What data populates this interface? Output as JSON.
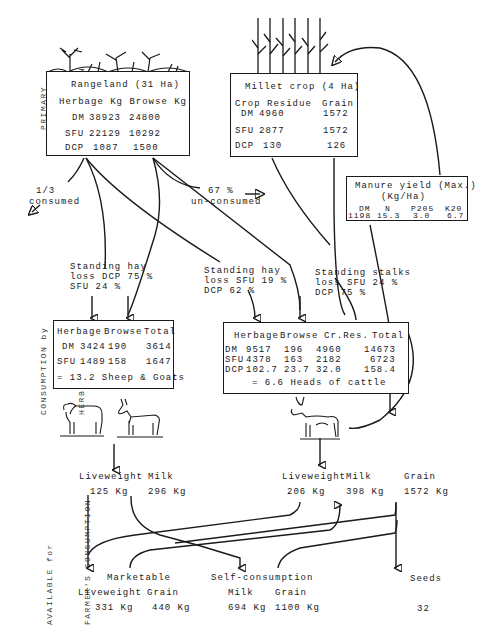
{
  "side_labels": {
    "primary": [
      "PRIMARY",
      "PRODUCTION"
    ],
    "consumption": [
      "CONSUMPTION by",
      "HERBIVORES"
    ],
    "available": [
      "AVAILABLE for",
      "FARMER'S CONSUMPTION"
    ]
  },
  "rangeland": {
    "title": "Rangeland (31 Ha)",
    "header": "Herbage Kg Browse Kg",
    "rows": [
      {
        "label": "DM",
        "herbage": "38923",
        "browse": "24800"
      },
      {
        "label": "SFU",
        "herbage": "22129",
        "browse": "10292"
      },
      {
        "label": "DCP",
        "herbage": "1087",
        "browse": "1500"
      }
    ]
  },
  "millet": {
    "title": "Millet crop (4 Ha)",
    "header_residue": "Crop Residue",
    "header_grain": "Grain",
    "rows": [
      {
        "label": "DM",
        "residue": "4960",
        "grain": "1572"
      },
      {
        "label": "SFU",
        "residue": "2877",
        "grain": "1572"
      },
      {
        "label": "DCP",
        "residue": "130",
        "grain": "126"
      }
    ]
  },
  "manure": {
    "title": "Manure yield (Max.)",
    "unit": "(Kg/Ha)",
    "cols": [
      "DM",
      "N",
      "P205",
      "K20"
    ],
    "values": [
      "1198",
      "15.3",
      "3.0",
      "6.7"
    ]
  },
  "annotations": {
    "consumed": [
      "1/3",
      "consumed"
    ],
    "unconsumed": [
      "67 %",
      "un-consumed"
    ],
    "hay1": [
      "Standing hay",
      "loss DCP 75 %",
      "SFU 24 %"
    ],
    "hay2": [
      "Standing hay",
      "loss SFU 19 %",
      "DCP 62 %"
    ],
    "stalks": [
      "Standing stalks",
      "loss SFU 24 %",
      "DCP 75 %"
    ]
  },
  "small_stock": {
    "header": [
      "Herbage",
      "Browse",
      "Total"
    ],
    "rows": [
      {
        "label": "DM",
        "herbage": "3424",
        "browse": "190",
        "total": "3614"
      },
      {
        "label": "SFU",
        "herbage": "1489",
        "browse": "158",
        "total": "1647"
      }
    ],
    "equivalent": "= 13.2 Sheep & Goats"
  },
  "cattle": {
    "header": [
      "Herbage",
      "Browse",
      "Cr.Res.",
      "Total"
    ],
    "rows": [
      {
        "label": "DM",
        "herbage": "9517",
        "browse": "196",
        "crres": "4960",
        "total": "14673"
      },
      {
        "label": "SFU",
        "herbage": "4378",
        "browse": "163",
        "crres": "2182",
        "total": "6723"
      },
      {
        "label": "DCP",
        "herbage": "102.7",
        "browse": "23.7",
        "crres": "32.0",
        "total": "158.4"
      }
    ],
    "equivalent": "= 6.6 Heads of cattle"
  },
  "outputs": {
    "small_stock": {
      "lw_label": "Liveweight",
      "milk_label": "Milk",
      "lw": "125 Kg",
      "milk": "296 Kg"
    },
    "cattle": {
      "lw_label": "Liveweight",
      "milk_label": "Milk",
      "lw": "206 Kg",
      "milk": "398 Kg"
    },
    "grain": {
      "label": "Grain",
      "value": "1572 Kg"
    }
  },
  "final": {
    "marketable": {
      "title": "Marketable",
      "lw_label": "Liveweight",
      "grain_label": "Grain",
      "lw": "331 Kg",
      "grain": "440 Kg"
    },
    "self": {
      "title": "Self-consumption",
      "milk_label": "Milk",
      "grain_label": "Grain",
      "milk": "694 Kg",
      "grain": "1100 Kg"
    },
    "seeds": {
      "title": "Seeds",
      "value": "32"
    }
  }
}
